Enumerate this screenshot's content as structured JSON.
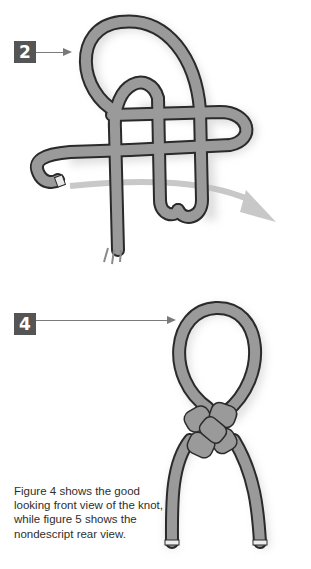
{
  "figures": [
    {
      "step_label": "2",
      "description": "Knot tying step 2 – rope loops crossed, arrow showing working end direction"
    },
    {
      "step_label": "4",
      "description": "Finished knot – front view with loop on top and two standing ends"
    }
  ],
  "caption": {
    "text": "Figure 4 shows the good looking front view of the knot, while figure 5 shows the nondescript rear view."
  },
  "colors": {
    "rope_fill": "#9a9a9a",
    "rope_outline": "#2a2a2a",
    "badge_bg": "#555555",
    "arrow": "#7a7a7a",
    "shadow": "#d4d4d4"
  }
}
